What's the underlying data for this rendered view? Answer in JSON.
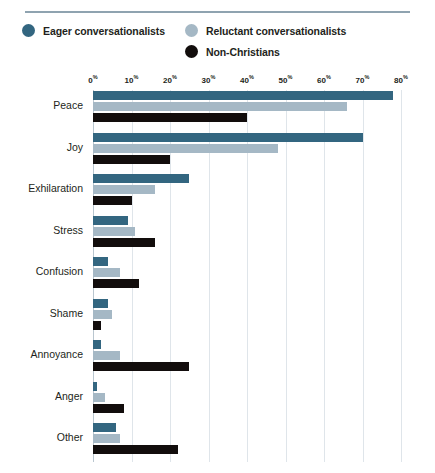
{
  "chart_data": {
    "type": "bar",
    "orientation": "horizontal",
    "title": "",
    "subtitle": "",
    "xlabel": "",
    "ylabel": "",
    "xlim": [
      0,
      80
    ],
    "xticks": [
      0,
      10,
      20,
      30,
      40,
      50,
      60,
      70,
      80
    ],
    "xtick_labels": [
      "0%",
      "10%",
      "20%",
      "30%",
      "40%",
      "50%",
      "60%",
      "70%",
      "80%"
    ],
    "tick_suffix": "%",
    "grid": true,
    "grid_axis": "x",
    "legend_position": "top",
    "categories": [
      "Peace",
      "Joy",
      "Exhilaration",
      "Stress",
      "Confusion",
      "Shame",
      "Annoyance",
      "Anger",
      "Other"
    ],
    "series": [
      {
        "name": "Eager conversationalists",
        "color": "#336680",
        "values": [
          78,
          70,
          25,
          9,
          4,
          4,
          2,
          1,
          6
        ]
      },
      {
        "name": "Reluctant conversationalists",
        "color": "#a5b8c5",
        "values": [
          66,
          48,
          16,
          11,
          7,
          5,
          7,
          3,
          7
        ]
      },
      {
        "name": "Non-Christians",
        "color": "#120d0c",
        "values": [
          40,
          20,
          10,
          16,
          12,
          2,
          25,
          8,
          22
        ]
      }
    ]
  },
  "legend": {
    "items": [
      {
        "label": "Eager conversationalists",
        "color": "#336680"
      },
      {
        "label": "Reluctant conversationalists",
        "color": "#a5b8c5"
      },
      {
        "label": "Non-Christians",
        "color": "#120d0c"
      }
    ]
  },
  "style": {
    "rule_color": "#8fa3b0",
    "gridline_color": "#dfe5ea",
    "axis_color": "#b9c6cf",
    "text_color": "#231f20",
    "background": "#ffffff"
  }
}
